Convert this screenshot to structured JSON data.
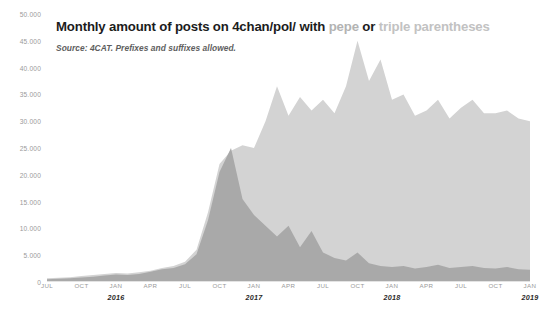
{
  "title": {
    "prefix": "Monthly amount of posts on 4chan/pol/ with ",
    "term_a": "pepe",
    "conjunction": " or ",
    "term_b": "triple parentheses"
  },
  "subtitle": "Source: 4CAT. Prefixes and suffixes allowed.",
  "colors": {
    "series_pepe": "#a9a9a9",
    "series_triple_parentheses": "#d3d3d3",
    "axis_text": "#9a9a9a",
    "title_text": "#1c1c1c",
    "subtitle_text": "#5e5e5e",
    "background": "#ffffff"
  },
  "chart_data": {
    "type": "area",
    "title": "Monthly amount of posts on 4chan/pol/ with pepe or triple parentheses",
    "subtitle": "Source: 4CAT. Prefixes and suffixes allowed.",
    "xlabel": "",
    "ylabel": "",
    "ylim": [
      0,
      50000
    ],
    "grid": false,
    "legend_position": "in-title",
    "stacked": false,
    "overlapping": true,
    "y_ticks": [
      0,
      5000,
      10000,
      15000,
      20000,
      25000,
      30000,
      35000,
      40000,
      45000,
      50000
    ],
    "y_tick_labels": [
      "0",
      "5.000",
      "10.000",
      "15.000",
      "20.000",
      "25.000",
      "30.000",
      "35.000",
      "40.000",
      "45.000",
      "50.000"
    ],
    "x_tick_labels": [
      "JUL",
      "OCT",
      "JAN",
      "APR",
      "JUL",
      "OCT",
      "JAN",
      "APR",
      "JUL",
      "OCT",
      "JAN",
      "APR",
      "JUL",
      "OCT",
      "JAN"
    ],
    "x_year_labels": [
      {
        "index": 2,
        "label": "2016"
      },
      {
        "index": 6,
        "label": "2017"
      },
      {
        "index": 10,
        "label": "2018"
      },
      {
        "index": 14,
        "label": "2019"
      }
    ],
    "x": [
      "2015-07",
      "2015-08",
      "2015-09",
      "2015-10",
      "2015-11",
      "2015-12",
      "2016-01",
      "2016-02",
      "2016-03",
      "2016-04",
      "2016-05",
      "2016-06",
      "2016-07",
      "2016-08",
      "2016-09",
      "2016-10",
      "2016-11",
      "2016-12",
      "2017-01",
      "2017-02",
      "2017-03",
      "2017-04",
      "2017-05",
      "2017-06",
      "2017-07",
      "2017-08",
      "2017-09",
      "2017-10",
      "2017-11",
      "2017-12",
      "2018-01",
      "2018-02",
      "2018-03",
      "2018-04",
      "2018-05",
      "2018-06",
      "2018-07",
      "2018-08",
      "2018-09",
      "2018-10",
      "2018-11",
      "2018-12",
      "2019-01"
    ],
    "series": [
      {
        "name": "triple parentheses",
        "color": "#d3d3d3",
        "values": [
          700,
          800,
          900,
          1100,
          1300,
          1500,
          1700,
          1600,
          1800,
          2100,
          2600,
          3000,
          3800,
          6000,
          13000,
          22000,
          24500,
          25500,
          25000,
          30000,
          36500,
          31000,
          34500,
          32000,
          34000,
          31500,
          36500,
          45000,
          37500,
          41500,
          34000,
          35000,
          31000,
          32000,
          34000,
          30500,
          32500,
          34000,
          31500,
          31500,
          32000,
          30500,
          30000
        ]
      },
      {
        "name": "pepe",
        "color": "#a9a9a9",
        "values": [
          500,
          600,
          700,
          850,
          1000,
          1200,
          1400,
          1300,
          1500,
          1900,
          2400,
          2600,
          3300,
          5200,
          11500,
          20500,
          25000,
          15500,
          12500,
          10500,
          8500,
          10500,
          6500,
          9500,
          5500,
          4500,
          4000,
          5500,
          3500,
          3000,
          2800,
          3000,
          2500,
          2800,
          3200,
          2600,
          2800,
          3000,
          2600,
          2500,
          2800,
          2400,
          2300
        ]
      }
    ]
  }
}
